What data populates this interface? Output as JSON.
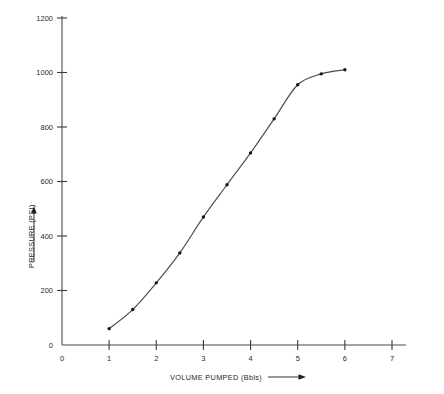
{
  "chart_data": {
    "type": "line",
    "title": "",
    "xlabel": "VOLUME PUMPED (Bbls)",
    "ylabel": "PRESSURE (PSI)",
    "xlim": [
      0,
      7
    ],
    "ylim": [
      0,
      1200
    ],
    "xticks": [
      0,
      1,
      2,
      3,
      4,
      5,
      6,
      7
    ],
    "xtick_labels": [
      "0",
      "1",
      "2",
      "3",
      "4",
      "5",
      "6",
      "7"
    ],
    "yticks": [
      0,
      200,
      400,
      600,
      800,
      1000,
      1200
    ],
    "ytick_labels": [
      "0",
      "200",
      "400",
      "600",
      "800",
      "1000",
      "1200"
    ],
    "grid": false,
    "legend": null,
    "series": [
      {
        "name": "Pressure vs Volume Pumped",
        "marker": "dot",
        "x": [
          1.0,
          1.5,
          2.0,
          2.5,
          3.0,
          3.5,
          4.0,
          4.5,
          5.0,
          5.5,
          6.0
        ],
        "y": [
          60,
          130,
          228,
          338,
          470,
          588,
          705,
          830,
          955,
          995,
          1010
        ]
      }
    ],
    "annotations": {
      "xlabel_arrow": "→",
      "ylabel_arrow": "↑"
    }
  },
  "axis_labels": {
    "x_title": "VOLUME PUMPED (Bbls)",
    "y_title": "PRESSURE (PSI)"
  },
  "colors": {
    "curve": "#4a4a4a",
    "marker": "#141414",
    "axis": "#4a4a4a",
    "text": "#2b2b2b",
    "background": "#ffffff"
  }
}
